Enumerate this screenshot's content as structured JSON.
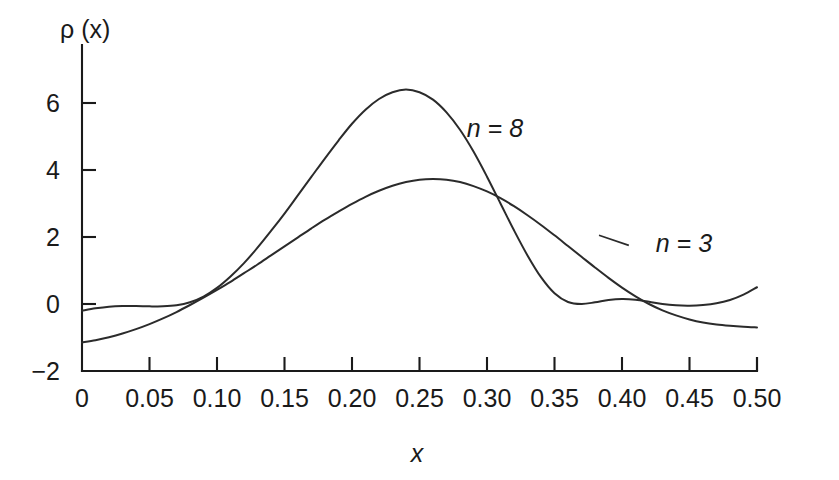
{
  "chart_data": {
    "type": "line",
    "title": "",
    "xlabel": "x",
    "ylabel": "ρ (x)",
    "xlim": [
      0,
      0.5
    ],
    "ylim": [
      -2,
      7
    ],
    "grid": false,
    "legend_position": "inline-annotations",
    "xticks": [
      "0",
      "0.05",
      "0.10",
      "0.15",
      "0.20",
      "0.25",
      "0.30",
      "0.35",
      "0.40",
      "0.45",
      "0.50"
    ],
    "xtick_values": [
      0,
      0.05,
      0.1,
      0.15,
      0.2,
      0.25,
      0.3,
      0.35,
      0.4,
      0.45,
      0.5
    ],
    "yticks": [
      "6",
      "4",
      "2",
      "0",
      "−2"
    ],
    "ytick_values": [
      6,
      4,
      2,
      0,
      -2
    ],
    "series": [
      {
        "name": "n = 8",
        "label": "n = 8",
        "x": [
          0.0,
          0.01,
          0.02,
          0.03,
          0.04,
          0.05,
          0.06,
          0.07,
          0.08,
          0.09,
          0.1,
          0.11,
          0.12,
          0.13,
          0.14,
          0.15,
          0.16,
          0.17,
          0.18,
          0.19,
          0.2,
          0.21,
          0.22,
          0.23,
          0.24,
          0.25,
          0.26,
          0.27,
          0.28,
          0.29,
          0.3,
          0.31,
          0.32,
          0.33,
          0.34,
          0.35,
          0.36,
          0.37,
          0.38,
          0.39,
          0.4,
          0.41,
          0.42,
          0.43,
          0.44,
          0.45,
          0.46,
          0.47,
          0.48,
          0.49,
          0.5
        ],
        "y": [
          -0.2,
          -0.13,
          -0.08,
          -0.06,
          -0.06,
          -0.07,
          -0.07,
          -0.04,
          0.05,
          0.22,
          0.48,
          0.82,
          1.22,
          1.68,
          2.18,
          2.7,
          3.25,
          3.8,
          4.35,
          4.88,
          5.38,
          5.8,
          6.12,
          6.32,
          6.4,
          6.32,
          6.1,
          5.72,
          5.2,
          4.55,
          3.8,
          3.0,
          2.2,
          1.45,
          0.8,
          0.32,
          0.06,
          0.0,
          0.05,
          0.12,
          0.15,
          0.13,
          0.07,
          0.0,
          -0.04,
          -0.05,
          -0.03,
          0.02,
          0.12,
          0.28,
          0.5
        ]
      },
      {
        "name": "n = 3",
        "label": "n = 3",
        "x": [
          0.0,
          0.01,
          0.02,
          0.03,
          0.04,
          0.05,
          0.06,
          0.07,
          0.08,
          0.09,
          0.1,
          0.11,
          0.12,
          0.13,
          0.14,
          0.15,
          0.16,
          0.17,
          0.18,
          0.19,
          0.2,
          0.21,
          0.22,
          0.23,
          0.24,
          0.25,
          0.26,
          0.27,
          0.28,
          0.29,
          0.3,
          0.31,
          0.32,
          0.33,
          0.34,
          0.35,
          0.36,
          0.37,
          0.38,
          0.39,
          0.4,
          0.41,
          0.42,
          0.43,
          0.44,
          0.45,
          0.46,
          0.47,
          0.48,
          0.49,
          0.5
        ],
        "y": [
          -1.15,
          -1.08,
          -0.99,
          -0.88,
          -0.75,
          -0.6,
          -0.43,
          -0.24,
          -0.03,
          0.19,
          0.42,
          0.66,
          0.92,
          1.18,
          1.45,
          1.72,
          1.99,
          2.26,
          2.52,
          2.76,
          2.99,
          3.2,
          3.38,
          3.53,
          3.64,
          3.71,
          3.73,
          3.71,
          3.64,
          3.52,
          3.36,
          3.16,
          2.92,
          2.65,
          2.36,
          2.05,
          1.73,
          1.41,
          1.09,
          0.78,
          0.49,
          0.23,
          0.0,
          -0.19,
          -0.34,
          -0.46,
          -0.55,
          -0.61,
          -0.65,
          -0.68,
          -0.7
        ]
      }
    ],
    "annotations": [
      {
        "text": "n = 8",
        "x": 0.285,
        "y": 5.0
      },
      {
        "text": "n = 3",
        "x": 0.425,
        "y": 1.55
      }
    ]
  },
  "colors": {
    "curve": "#2b2b2b",
    "axis": "#1a1a1a",
    "background": "#ffffff"
  }
}
